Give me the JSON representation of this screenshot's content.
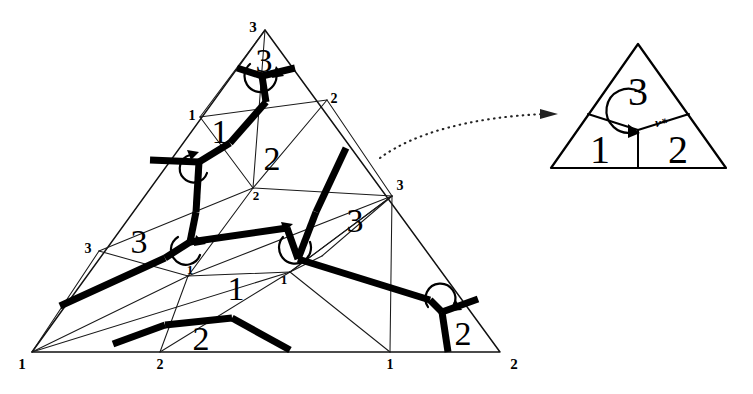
{
  "figure": {
    "background_color": "#ffffff",
    "ink_color": "#000000"
  },
  "main_triangle": {
    "name": "main-simplex",
    "corner_labels": {
      "bottom_left": "1",
      "bottom_right": "2",
      "apex": "3"
    },
    "edge_labels": {
      "bottom_mid_left": "2",
      "bottom_mid_right": "1",
      "left_upper": "1",
      "left_lower": "3",
      "right_upper": "2",
      "right_lower": "3"
    },
    "interior_labels": {
      "apex_region": "3",
      "upper_left_region": "1",
      "center_upper_region": "2",
      "center_node_small": "2",
      "left_region": "3",
      "center_node_small_left": "1",
      "center_lower_region": "1",
      "center_lower_small_right": "1",
      "right_region": "3",
      "bottom_region": "2",
      "bottom_right_region": "2"
    }
  },
  "detail_triangle": {
    "name": "detail-inset",
    "region_labels": {
      "left": "1",
      "right": "2",
      "top": "3"
    },
    "vertex_annotation": "v*"
  },
  "connector": {
    "name": "zoom-connector",
    "style": "dotted-curved-arrow",
    "direction": "left-to-right"
  }
}
